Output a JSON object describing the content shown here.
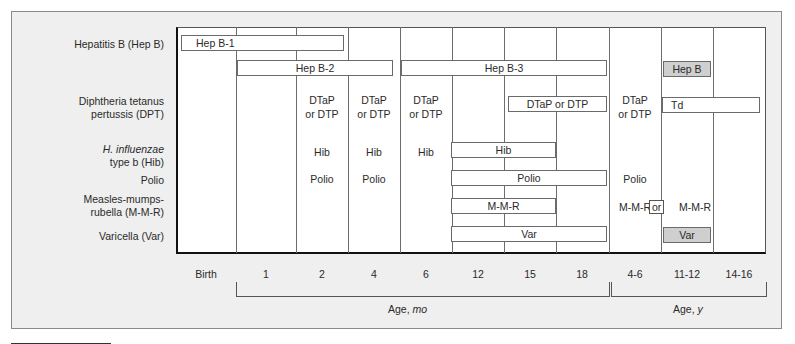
{
  "vaccines": [
    {
      "id": "hepb",
      "label_line1": "Hepatitis B (Hep B)",
      "label_line2": ""
    },
    {
      "id": "dpt",
      "label_line1": "Diphtheria tetanus",
      "label_line2": "pertussis (DPT)"
    },
    {
      "id": "hib",
      "label_line1_italic": "H. influenzae",
      "label_line2": "type b (Hib)"
    },
    {
      "id": "polio",
      "label_line1": "Polio"
    },
    {
      "id": "mmr",
      "label_line1": "Measles-mumps-",
      "label_line2": "rubella (M-M-R)"
    },
    {
      "id": "var",
      "label_line1": "Varicella (Var)"
    }
  ],
  "ages": [
    "Birth",
    "1",
    "2",
    "4",
    "6",
    "12",
    "15",
    "18",
    "4-6",
    "11-12",
    "14-16"
  ],
  "axis": {
    "months_label": "Age, ",
    "months_unit": "mo",
    "years_label": "Age, ",
    "years_unit": "y"
  },
  "bars": {
    "hepb1": "Hep B-1",
    "hepb2": "Hep B-2",
    "hepb3": "Hep B-3",
    "hepb_catchup": "Hep B",
    "dtap_range": "DTaP or DTP",
    "td": "Td",
    "hib_range": "Hib",
    "polio_range": "Polio",
    "mmr_range": "M-M-R",
    "var_range": "Var",
    "var_catchup": "Var"
  },
  "cells": {
    "dtap_line1": "DTaP",
    "dtap_line2": "or DTP",
    "hib": "Hib",
    "polio": "Polio",
    "mmr": "M-M-R",
    "or": "or"
  },
  "colors": {
    "panel": "#efefef",
    "shaded_bar": "#cfcfcf",
    "grid": "#6d6d6d"
  }
}
